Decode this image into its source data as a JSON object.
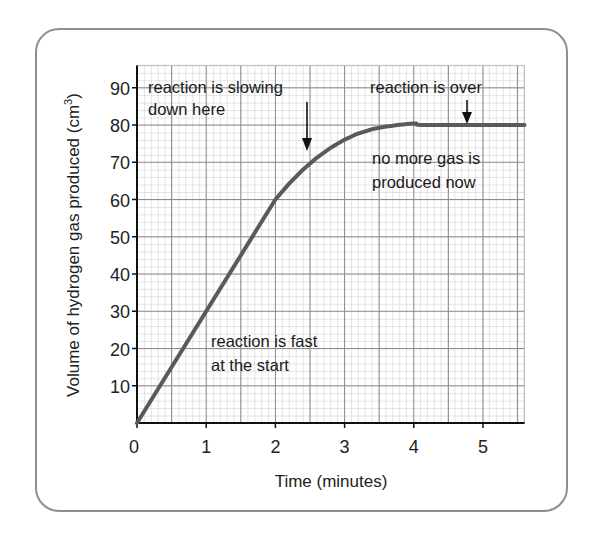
{
  "chart_data": {
    "type": "line",
    "title": "",
    "xlabel": "Time (minutes)",
    "ylabel": "Volume of hydrogen gas produced (cm³)",
    "xlim": [
      0,
      5.6
    ],
    "ylim": [
      0,
      96
    ],
    "x_ticks": [
      "0",
      "1",
      "2",
      "3",
      "4",
      "5"
    ],
    "y_ticks": [
      "10",
      "20",
      "30",
      "40",
      "50",
      "60",
      "70",
      "80",
      "90"
    ],
    "grid": true,
    "legend": null,
    "series": [
      {
        "name": "Hydrogen gas volume",
        "x": [
          0,
          0.5,
          1,
          1.5,
          2,
          2.5,
          3,
          3.5,
          4,
          4.5,
          5,
          5.6
        ],
        "y": [
          0,
          15,
          30,
          45,
          60,
          70,
          76,
          79,
          80,
          80,
          80,
          80
        ]
      }
    ],
    "annotations": [
      {
        "text": [
          "reaction is slowing",
          "down here"
        ],
        "arrow_to": [
          2.5,
          70
        ]
      },
      {
        "text": [
          "reaction is over"
        ],
        "arrow_to": [
          4.75,
          80
        ]
      },
      {
        "text": [
          "no more gas is",
          "produced now"
        ]
      },
      {
        "text": [
          "reaction is fast",
          "at the start"
        ]
      }
    ]
  },
  "labels": {
    "xlabel": "Time (minutes)",
    "ylabel_main": "Volume of hydrogen gas produced (cm",
    "ylabel_sup": "3",
    "ylabel_end": ")",
    "ann_slowing_1": "reaction is slowing",
    "ann_slowing_2": "down here",
    "ann_over": "reaction is over",
    "ann_nomore_1": "no more gas is",
    "ann_nomore_2": "produced now",
    "ann_fast_1": "reaction is fast",
    "ann_fast_2": "at the start"
  },
  "colors": {
    "curve": "#5a5a5a",
    "grid_minor": "#b8b8b8",
    "grid_major": "#8c8c8c",
    "axis": "#111111",
    "frame": "#8f8f8f"
  }
}
